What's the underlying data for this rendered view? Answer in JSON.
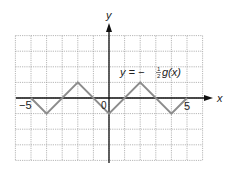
{
  "chart_data": {
    "type": "line",
    "title": "",
    "annotation": "y = −½g(x)",
    "xlabel": "x",
    "ylabel": "y",
    "xlim": [
      -6,
      6
    ],
    "ylim": [
      -4,
      4
    ],
    "tick_labels": {
      "x_neg": "−5",
      "origin": "0",
      "x_pos": "5"
    },
    "grid": true,
    "series": [
      {
        "name": "y = -1/2 g(x)",
        "x": [
          -5,
          -4,
          -2,
          0,
          2,
          4,
          5
        ],
        "y": [
          0,
          -1,
          1,
          -1,
          1,
          -1,
          0
        ]
      }
    ]
  },
  "labels": {
    "y_axis": "y",
    "x_axis": "x",
    "equation_prefix": "y = −",
    "equation_frac_num": "1",
    "equation_frac_den": "2",
    "equation_suffix": "g(x)",
    "tick_neg5": "−5",
    "tick_0": "0",
    "tick_5": "5"
  },
  "colors": {
    "grid": "#9a9a9a",
    "axis": "#111111",
    "curve": "#8c8c8c"
  }
}
